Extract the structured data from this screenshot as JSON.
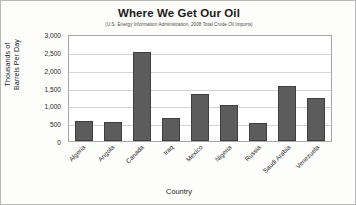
{
  "chart_data": {
    "type": "bar",
    "title": "Where We Get Our Oil",
    "subtitle": "(U.S. Energy Information Administration, 2008 Total Crude Oil Imports)",
    "xlabel": "Country",
    "ylabel": "Thousands of Barrels Per Day",
    "ylabel_lines": [
      "Thousands of",
      "Barrels Per Day"
    ],
    "categories": [
      "Algeria",
      "Angola",
      "Canada",
      "Iraq",
      "Mexico",
      "Nigeria",
      "Russia",
      "Saudi Arabia",
      "Venezuela"
    ],
    "values": [
      560,
      530,
      2500,
      650,
      1320,
      1010,
      500,
      1550,
      1210
    ],
    "ylim": [
      0,
      3000
    ],
    "yticks": [
      0,
      500,
      1000,
      1500,
      2000,
      2500,
      3000
    ],
    "ytick_labels": [
      "0",
      "500",
      "1,000",
      "1,500",
      "2,000",
      "2,500",
      "3,000"
    ],
    "grid": true,
    "legend": false,
    "bar_color": "#5c5c5c",
    "bar_border_color": "#3f3f3f",
    "gridline_color": "#d4d4d4",
    "plot_background": "#ffffff",
    "xtick_rotation": -45
  }
}
